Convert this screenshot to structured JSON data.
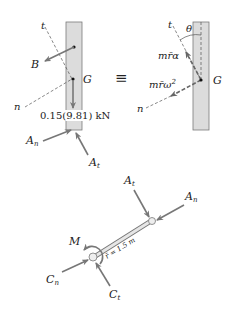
{
  "figure": {
    "colors": {
      "bar_fill": "#dcdcdc",
      "bar_stroke": "#7a7a7a",
      "arrow": "#777777",
      "dash": "#555555",
      "text": "#222222"
    },
    "fbd": {
      "axis_t": "t",
      "axis_n": "n",
      "force_B": "B",
      "center_G": "G",
      "weight": "0.15(9.81) kN",
      "force_An": "A",
      "force_An_sub": "n",
      "force_At": "A",
      "force_At_sub": "t"
    },
    "equivalence_symbol": "≡",
    "kd": {
      "axis_t": "t",
      "axis_n": "n",
      "angle": "θ",
      "tangential": "mr̄α",
      "normal": "mr̄ω",
      "normal_exp": "2",
      "center_G": "G"
    },
    "link": {
      "force_At": "A",
      "force_At_sub": "t",
      "force_An": "A",
      "force_An_sub": "n",
      "moment": "M",
      "radius_label": "r̄ = 1.5 m",
      "force_Cn": "C",
      "force_Cn_sub": "n",
      "force_Ct": "C",
      "force_Ct_sub": "t"
    }
  }
}
